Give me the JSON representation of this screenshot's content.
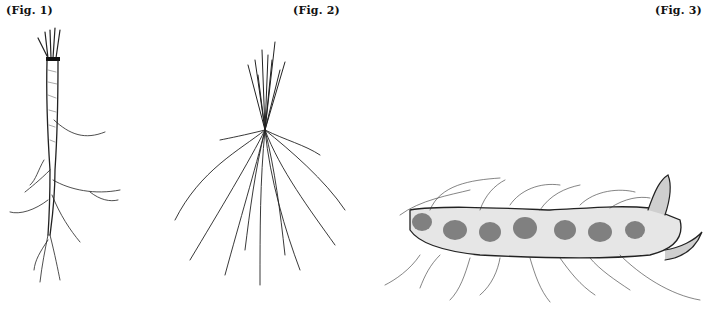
{
  "figures": [
    {
      "label": "(Fig. 1)",
      "subject": "taproot-with-crown",
      "ink": "#222222"
    },
    {
      "label": "(Fig. 2)",
      "subject": "fibrous-root-system",
      "ink": "#222222"
    },
    {
      "label": "(Fig. 3)",
      "subject": "rhizome-with-rootlets",
      "ink": "#222222"
    }
  ],
  "background": "#ffffff"
}
